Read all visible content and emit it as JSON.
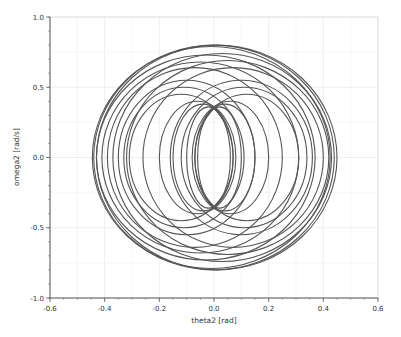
{
  "chart_data": {
    "type": "line",
    "title": "",
    "xlabel": "theta2 [rad]",
    "ylabel": "omega2 [rad/s]",
    "xlim": [
      -0.6,
      0.6
    ],
    "ylim": [
      -1.0,
      1.0
    ],
    "x_ticks": [
      "-0.6",
      "-0.4",
      "-0.2",
      "0.0",
      "0.2",
      "0.4",
      "0.6"
    ],
    "y_ticks": [
      "1.0",
      "0.5",
      "0.0",
      "-0.5",
      "-1.0"
    ],
    "grid": true,
    "legend": null,
    "series": [
      {
        "name": "trajectory",
        "color": "#555555",
        "loops": [
          {
            "cx": 0.0,
            "rx": 0.44,
            "ry": 0.8
          },
          {
            "cx": -0.01,
            "rx": 0.435,
            "ry": 0.79
          },
          {
            "cx": 0.01,
            "rx": 0.44,
            "ry": 0.8
          },
          {
            "cx": -0.03,
            "rx": 0.4,
            "ry": 0.73
          },
          {
            "cx": 0.03,
            "rx": 0.4,
            "ry": 0.74
          },
          {
            "cx": -0.05,
            "rx": 0.36,
            "ry": 0.68
          },
          {
            "cx": 0.05,
            "rx": 0.37,
            "ry": 0.69
          },
          {
            "cx": -0.07,
            "rx": 0.32,
            "ry": 0.64
          },
          {
            "cx": 0.07,
            "rx": 0.33,
            "ry": 0.64
          },
          {
            "cx": -0.1,
            "rx": 0.25,
            "ry": 0.55
          },
          {
            "cx": 0.1,
            "rx": 0.26,
            "ry": 0.55
          },
          {
            "cx": -0.11,
            "rx": 0.22,
            "ry": 0.5
          },
          {
            "cx": 0.11,
            "rx": 0.23,
            "ry": 0.5
          },
          {
            "cx": -0.12,
            "rx": 0.19,
            "ry": 0.45
          },
          {
            "cx": 0.12,
            "rx": 0.19,
            "ry": 0.45
          },
          {
            "cx": -0.04,
            "rx": 0.11,
            "ry": 0.38
          },
          {
            "cx": 0.04,
            "rx": 0.11,
            "ry": 0.38
          },
          {
            "cx": -0.02,
            "rx": 0.08,
            "ry": 0.36
          },
          {
            "cx": 0.02,
            "rx": 0.08,
            "ry": 0.36
          },
          {
            "cx": -0.06,
            "rx": 0.14,
            "ry": 0.4
          },
          {
            "cx": 0.06,
            "rx": 0.14,
            "ry": 0.4
          }
        ]
      }
    ]
  }
}
